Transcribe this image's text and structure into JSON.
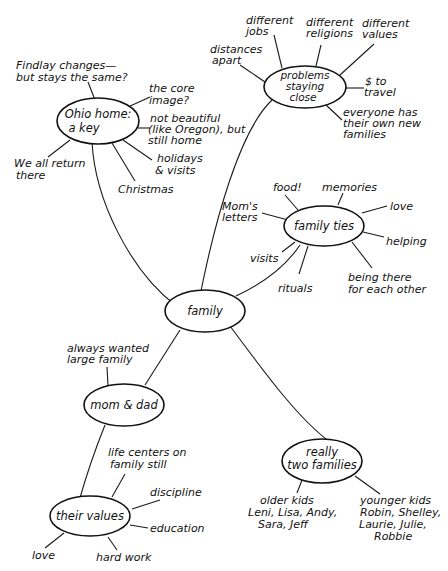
{
  "nodes": {
    "family": {
      "label": [
        "family"
      ]
    },
    "ohio": {
      "label": [
        "Ohio home:",
        "a key"
      ]
    },
    "problems": {
      "label": [
        "problems",
        "staying",
        "close"
      ]
    },
    "ties": {
      "label": [
        "family ties"
      ]
    },
    "momdad": {
      "label": [
        "mom & dad"
      ]
    },
    "values": {
      "label": [
        "their values"
      ]
    },
    "two": {
      "label": [
        "really",
        "two families"
      ]
    }
  },
  "leaves": {
    "ohio": [
      [
        "Findlay changes—",
        "but stays the same?"
      ],
      [
        "the core",
        "image?"
      ],
      [
        "not beautiful",
        "(like Oregon), but",
        "still home"
      ],
      [
        "holidays",
        "& visits"
      ],
      [
        "Christmas"
      ],
      [
        "We all return",
        "there"
      ]
    ],
    "problems": [
      [
        "distances",
        "apart"
      ],
      [
        "different",
        "jobs"
      ],
      [
        "different",
        "religions"
      ],
      [
        "different",
        "values"
      ],
      [
        "$ to",
        "travel"
      ],
      [
        "everyone has",
        "their own new",
        "families"
      ]
    ],
    "ties": [
      [
        "Mom's",
        "letters"
      ],
      [
        "food!"
      ],
      [
        "memories"
      ],
      [
        "love"
      ],
      [
        "helping"
      ],
      [
        "being there",
        "for each other"
      ],
      [
        "rituals"
      ],
      [
        "visits"
      ]
    ],
    "momdad": [
      [
        "always wanted",
        "large family"
      ]
    ],
    "values": [
      [
        "life centers on",
        "family still"
      ],
      [
        "discipline"
      ],
      [
        "education"
      ],
      [
        "hard work"
      ],
      [
        "love"
      ]
    ],
    "two": [
      [
        "older kids",
        "Leni, Lisa, Andy,",
        "Sara, Jeff"
      ],
      [
        "younger kids",
        "Robin, Shelley,",
        "Laurie, Julie,",
        "Robbie"
      ]
    ]
  }
}
